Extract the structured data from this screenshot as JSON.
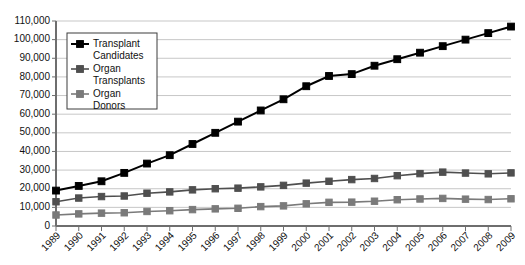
{
  "chart_data": {
    "type": "line",
    "title": "",
    "xlabel": "",
    "ylabel": "",
    "ylim": [
      0,
      110000
    ],
    "grid": true,
    "legend_position": "top-left",
    "categories": [
      "1989",
      "1990",
      "1991",
      "1992",
      "1993",
      "1994",
      "1995",
      "1996",
      "1997",
      "1998",
      "1999",
      "2000",
      "2001",
      "2002",
      "2003",
      "2004",
      "2005",
      "2006",
      "2007",
      "2008",
      "2009"
    ],
    "ytick_labels": [
      "110,000",
      "100,000",
      "90,000",
      "80,000",
      "70,000",
      "60,000",
      "50,000",
      "40,000",
      "30,000",
      "20,000",
      "10,000",
      "0"
    ],
    "ytick_values": [
      110000,
      100000,
      90000,
      80000,
      70000,
      60000,
      50000,
      40000,
      30000,
      20000,
      10000,
      0
    ],
    "series": [
      {
        "name": "Transplant Candidates",
        "color": "#000000",
        "values": [
          19000,
          21500,
          24000,
          28500,
          33500,
          38000,
          44000,
          50000,
          56000,
          62000,
          68000,
          75000,
          80500,
          81500,
          86000,
          89500,
          93000,
          96500,
          100000,
          103500,
          107000
        ]
      },
      {
        "name": "Organ Transplants",
        "color": "#4f4f4f",
        "values": [
          13000,
          15000,
          15800,
          16100,
          17600,
          18300,
          19400,
          20000,
          20300,
          21000,
          21800,
          23000,
          24000,
          24900,
          25500,
          27000,
          28100,
          28900,
          28400,
          28000,
          28500
        ]
      },
      {
        "name": "Organ Donors",
        "color": "#7a7a7a",
        "values": [
          5900,
          6500,
          6900,
          7100,
          7800,
          8200,
          8800,
          9200,
          9500,
          10400,
          10800,
          11900,
          12700,
          12800,
          13300,
          14100,
          14500,
          14800,
          14400,
          14200,
          14600
        ]
      }
    ]
  },
  "legend": {
    "entries": [
      {
        "label_line1": "Transplant",
        "label_line2": "Candidates"
      },
      {
        "label_line1": "Organ",
        "label_line2": "Transplants"
      },
      {
        "label_line1": "Organ",
        "label_line2": "Donors"
      }
    ]
  }
}
